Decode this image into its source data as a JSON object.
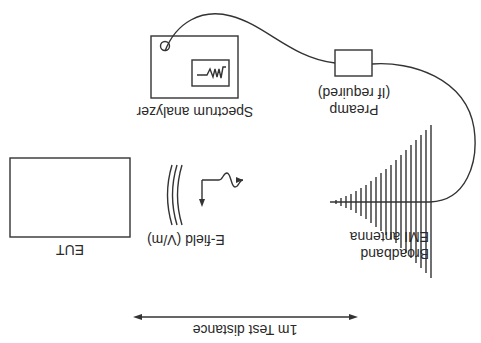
{
  "diagram": {
    "orientation": "rotated-180",
    "stroke_color": "#333333",
    "background": "#ffffff",
    "eut": {
      "label": "EUT"
    },
    "efield": {
      "label": "E-field (V/m)"
    },
    "antenna": {
      "label_line1": "Broadband",
      "label_line2": "EMI antenna"
    },
    "preamp": {
      "label_line1": "Preamp",
      "label_line2": "(If required)"
    },
    "analyzer": {
      "label": "Spectrum analyzer"
    },
    "distance": {
      "label": "1m Test distance"
    }
  }
}
